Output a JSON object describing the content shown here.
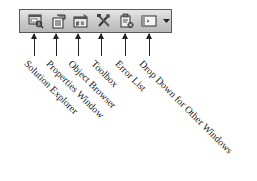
{
  "toolbar": {
    "buttons": [
      {
        "name": "Solution Explorer",
        "icon": "solution-explorer-icon"
      },
      {
        "name": "Properties Window",
        "icon": "properties-window-icon"
      },
      {
        "name": "Object Browser",
        "icon": "object-browser-icon"
      },
      {
        "name": "Toolbox",
        "icon": "toolbox-icon"
      },
      {
        "name": "Error List",
        "icon": "error-list-icon"
      },
      {
        "name": "Other Window",
        "icon": "window-icon"
      }
    ],
    "dropdown_icon": "chevron-down-icon"
  },
  "labels": [
    "Solution Explorer",
    "Properties Window",
    "Object Browser",
    "Toolbox",
    "Error List",
    "Drop Down for Other Windows"
  ]
}
